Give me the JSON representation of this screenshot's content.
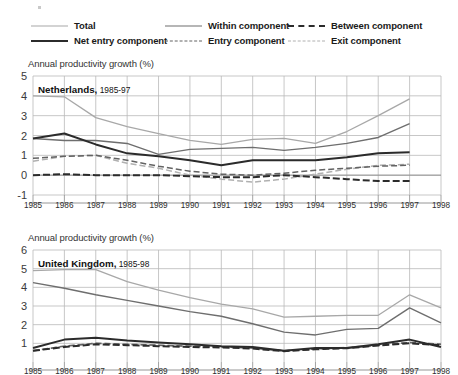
{
  "legend": {
    "items": [
      {
        "label": "Total",
        "style": "solid-light",
        "col": 1,
        "row": 1,
        "name": "legend-total"
      },
      {
        "label": "Net entry component",
        "style": "solid-dark",
        "col": 1,
        "row": 2,
        "name": "legend-net-entry-component"
      },
      {
        "label": "Within component",
        "style": "solid-mid",
        "col": 2,
        "row": 1,
        "name": "legend-within-component"
      },
      {
        "label": "Entry component",
        "style": "dash-mid",
        "col": 2,
        "row": 2,
        "name": "legend-entry-component"
      },
      {
        "label": "Between component",
        "style": "dash-dark",
        "col": 3,
        "row": 1,
        "name": "legend-between-component"
      },
      {
        "label": "Exit component",
        "style": "dash-light",
        "col": 3,
        "row": 2,
        "name": "legend-exit-component"
      }
    ]
  },
  "colors": {
    "total": "#a8a8a8",
    "within": "#6e6e6e",
    "between": "#2b2b2b",
    "net_entry": "#2b2b2b",
    "entry": "#636363",
    "exit": "#b0b0b0",
    "grid": "#b9b9b9",
    "axis": "#8a8a8a"
  },
  "panels": [
    {
      "axis_title": "Annual productivity growth (%)",
      "title_country": "Netherlands,",
      "title_period": " 1985-97"
    },
    {
      "axis_title": "Annual productivity growth (%)",
      "title_country": "United Kingdom,",
      "title_period": " 1985-98"
    }
  ],
  "chart_data": [
    {
      "type": "line",
      "title": "Netherlands, 1985-97",
      "xlabel": "",
      "ylabel": "Annual productivity growth (%)",
      "x": [
        1985,
        1986,
        1987,
        1988,
        1989,
        1990,
        1991,
        1992,
        1993,
        1994,
        1995,
        1996,
        1997
      ],
      "xlim": [
        1985,
        1998
      ],
      "ylim": [
        -1,
        5
      ],
      "yticks": [
        -1,
        0,
        1,
        2,
        3,
        4,
        5
      ],
      "xticks": [
        1985,
        1986,
        1987,
        1988,
        1989,
        1990,
        1991,
        1992,
        1993,
        1994,
        1995,
        1996,
        1997,
        1998
      ],
      "grid": true,
      "legend_position": "above-figure",
      "series": [
        {
          "name": "Total",
          "style": "solid-light",
          "values": [
            4.0,
            3.95,
            2.9,
            2.45,
            2.1,
            1.75,
            1.55,
            1.8,
            1.85,
            1.6,
            2.2,
            3.0,
            3.85
          ]
        },
        {
          "name": "Within component",
          "style": "solid-mid",
          "values": [
            1.85,
            1.75,
            1.75,
            1.6,
            1.05,
            1.3,
            1.35,
            1.4,
            1.25,
            1.4,
            1.6,
            1.9,
            2.6
          ]
        },
        {
          "name": "Net entry component",
          "style": "solid-dark",
          "values": [
            1.85,
            2.1,
            1.55,
            1.1,
            0.95,
            0.75,
            0.5,
            0.75,
            0.75,
            0.75,
            0.9,
            1.1,
            1.15
          ]
        },
        {
          "name": "Entry component",
          "style": "dash-mid",
          "values": [
            0.85,
            0.95,
            1.0,
            0.75,
            0.45,
            0.2,
            0.05,
            0.0,
            0.1,
            0.25,
            0.35,
            0.45,
            0.5
          ]
        },
        {
          "name": "Exit component",
          "style": "dash-light",
          "values": [
            0.7,
            0.95,
            1.0,
            0.6,
            0.35,
            0.0,
            -0.2,
            -0.35,
            -0.2,
            0.05,
            0.3,
            0.5,
            0.55
          ]
        },
        {
          "name": "Between component",
          "style": "dash-dark",
          "values": [
            0.0,
            0.05,
            0.0,
            0.0,
            0.0,
            -0.05,
            -0.1,
            -0.1,
            0.0,
            -0.1,
            -0.2,
            -0.3,
            -0.3
          ]
        }
      ]
    },
    {
      "type": "line",
      "title": "United Kingdom, 1985-98",
      "xlabel": "",
      "ylabel": "Annual productivity growth (%)",
      "x": [
        1985,
        1986,
        1987,
        1988,
        1989,
        1990,
        1991,
        1992,
        1993,
        1994,
        1995,
        1996,
        1997,
        1998
      ],
      "xlim": [
        1985,
        1998
      ],
      "ylim": [
        0,
        6
      ],
      "yticks": [
        1,
        2,
        3,
        4,
        5,
        6
      ],
      "xticks": [
        1985,
        1986,
        1987,
        1988,
        1989,
        1990,
        1991,
        1992,
        1993,
        1994,
        1995,
        1996,
        1997,
        1998
      ],
      "grid": true,
      "legend_position": "above-figure",
      "series": [
        {
          "name": "Total",
          "style": "solid-light",
          "values": [
            4.9,
            4.95,
            4.95,
            4.3,
            3.85,
            3.45,
            3.1,
            2.85,
            2.4,
            2.45,
            2.5,
            2.5,
            3.6,
            2.9
          ]
        },
        {
          "name": "Within component",
          "style": "solid-mid",
          "values": [
            4.25,
            3.95,
            3.6,
            3.3,
            3.0,
            2.7,
            2.45,
            2.05,
            1.6,
            1.45,
            1.75,
            1.8,
            2.9,
            2.1
          ]
        },
        {
          "name": "Net entry component",
          "style": "solid-dark",
          "values": [
            0.75,
            1.2,
            1.3,
            1.15,
            1.05,
            0.95,
            0.85,
            0.8,
            0.6,
            0.75,
            0.75,
            0.95,
            1.2,
            0.8
          ]
        },
        {
          "name": "Entry component",
          "style": "dash-mid",
          "values": [
            0.6,
            0.85,
            1.0,
            0.95,
            0.9,
            0.85,
            0.8,
            0.75,
            0.6,
            0.7,
            0.75,
            0.9,
            1.05,
            0.95
          ]
        },
        {
          "name": "Exit component",
          "style": "dash-light",
          "values": [
            0.6,
            0.85,
            1.0,
            0.95,
            0.9,
            0.85,
            0.8,
            0.75,
            0.6,
            0.7,
            0.78,
            0.92,
            1.05,
            0.95
          ]
        },
        {
          "name": "Between component",
          "style": "dash-dark",
          "values": [
            0.6,
            0.8,
            0.95,
            0.9,
            0.85,
            0.8,
            0.78,
            0.72,
            0.58,
            0.68,
            0.74,
            0.88,
            1.0,
            0.9
          ]
        }
      ]
    }
  ]
}
